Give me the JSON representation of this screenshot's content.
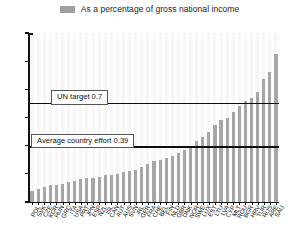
{
  "legend": {
    "swatch_name": "series-color-swatch",
    "label": "As a percentage of gross national income",
    "color": "#a0a0a0"
  },
  "annotations": {
    "un_target": {
      "label": "UN target 0.7",
      "value": 0.7
    },
    "average_effort": {
      "label": "Average country effort 0.39",
      "value": 0.39
    }
  },
  "axis": {
    "y_ticks": [
      "0.0",
      "0.2",
      "0.4",
      "0.6",
      "0.8",
      "1.0",
      "1.2"
    ],
    "y_min": 0.0,
    "y_max": 1.2,
    "y_step": 0.2
  },
  "chart_data": {
    "type": "bar",
    "title": "",
    "subtitle": "",
    "xlabel": "",
    "ylabel": "",
    "ylim": [
      0.0,
      1.2
    ],
    "ytick_values": [
      0.0,
      0.2,
      0.4,
      0.6,
      0.8,
      1.0,
      1.2
    ],
    "grid": false,
    "legend_position": "top-center",
    "series_name": "As a percentage of gross national income",
    "bar_color": "#a6a6a6",
    "categories": [
      "POL",
      "SVK",
      "CZE",
      "KOR",
      "HUN",
      "GRC",
      "ITA",
      "USA",
      "PRT",
      "JPN",
      "ESP",
      "NZL",
      "ISL",
      "CAN",
      "AUT",
      "AUS",
      "SVN",
      "IRL",
      "GER",
      "FRA",
      "CHE",
      "BEL",
      "FIN",
      "NLD",
      "GBR",
      "DNK",
      "NOR",
      "SWE",
      "LUX",
      "EST",
      "LTU",
      "LVA",
      "CYP",
      "MLT",
      "ROU",
      "BGR",
      "HRV",
      "TUR",
      "RUS",
      "ARE",
      "SAU"
    ],
    "values": [
      0.08,
      0.09,
      0.11,
      0.12,
      0.12,
      0.13,
      0.14,
      0.15,
      0.16,
      0.17,
      0.17,
      0.18,
      0.19,
      0.19,
      0.2,
      0.21,
      0.22,
      0.23,
      0.25,
      0.27,
      0.29,
      0.3,
      0.31,
      0.33,
      0.35,
      0.37,
      0.4,
      0.43,
      0.46,
      0.5,
      0.55,
      0.58,
      0.6,
      0.64,
      0.68,
      0.72,
      0.74,
      0.78,
      0.87,
      0.92,
      1.05
    ],
    "reference_lines": [
      {
        "label": "UN target 0.7",
        "value": 0.7
      },
      {
        "label": "Average country effort 0.39",
        "value": 0.39
      }
    ]
  }
}
